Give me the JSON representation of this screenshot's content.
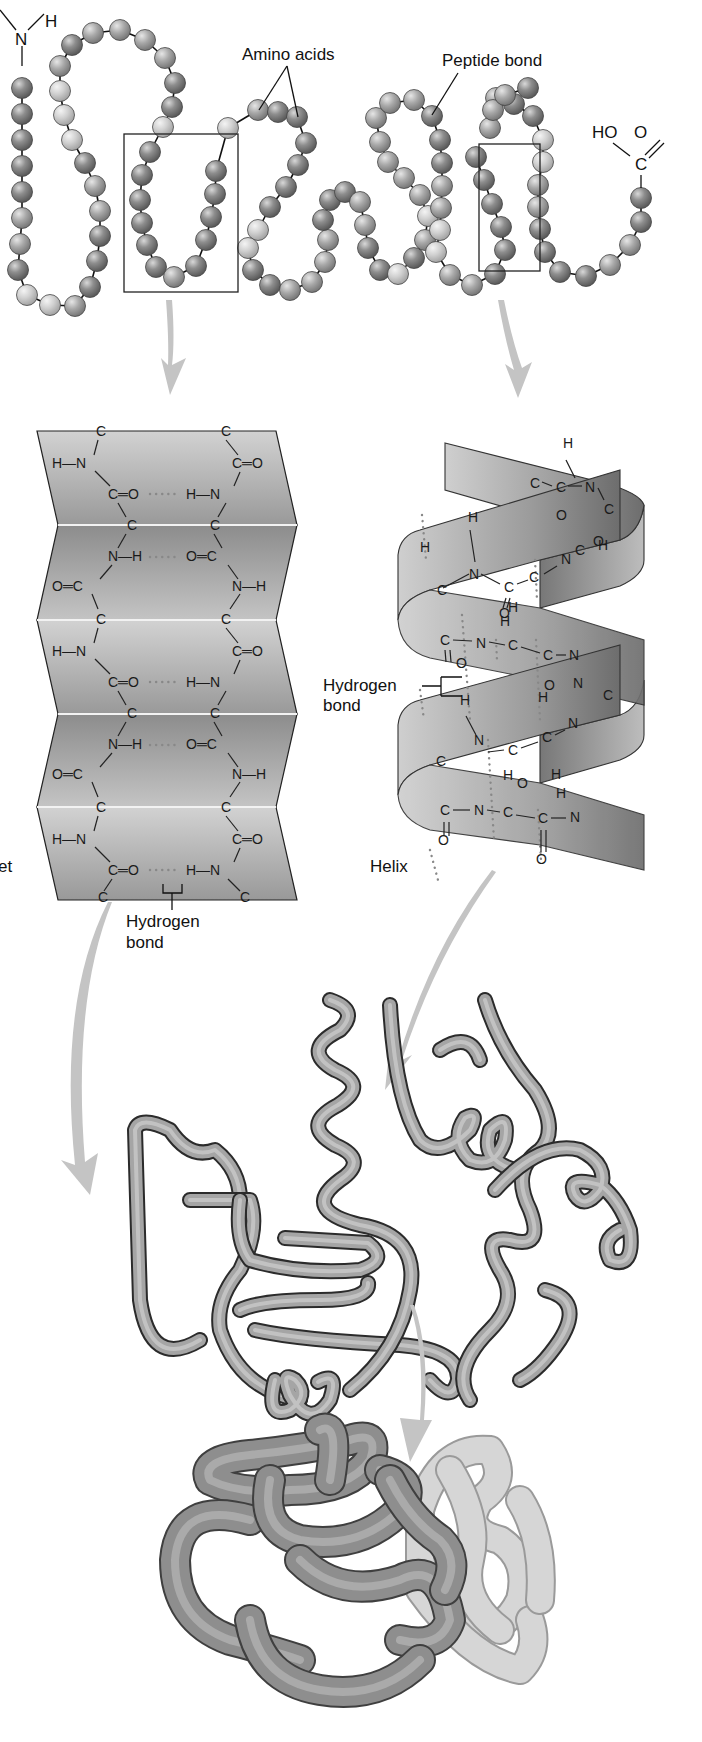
{
  "figure": {
    "primary": {
      "n_terminus": {
        "atom": "N",
        "hydrogen": "H"
      },
      "c_terminus": {
        "hydroxyl": "HO",
        "carbon": "C",
        "oxygen": "O"
      },
      "label_amino_acids": "Amino acids",
      "label_peptide_bond": "Peptide bond"
    },
    "sheet": {
      "label_partial": "et",
      "rows": [
        {
          "left": "H—N",
          "left_group": "C═O",
          "right": "C═O",
          "right_group": "H—N",
          "hbond": "C═O … H—N"
        },
        {
          "left": "N—H",
          "right": "O═C",
          "hbond": "N—H … O═C"
        }
      ],
      "atoms": {
        "C": "C",
        "N": "N",
        "H": "H",
        "O": "O",
        "HN": "H—N",
        "NH": "N—H",
        "CO": "C═O",
        "OC": "O═C",
        "CO_H_N": "C═O",
        "H_N": "H—N",
        "N_H": "N—H",
        "O_C": "O═C"
      },
      "hbond_label_line1": "Hydrogen",
      "hbond_label_line2": "bond"
    },
    "helix": {
      "label": "Helix",
      "hbond_label_line1": "Hydrogen",
      "hbond_label_line2": "bond",
      "atoms": {
        "C": "C",
        "N": "N",
        "H": "H",
        "O": "O"
      }
    },
    "tertiary": {
      "label": ""
    },
    "quaternary": {
      "label": ""
    },
    "colors": {
      "bead_dark": "#8a8a8a",
      "bead_mid": "#a8a8a8",
      "bead_light": "#cfcfcf",
      "sheet_fill": "#b5b5b5",
      "ribbon": "#9a9a9a",
      "globule_dark": "#8d8d8d",
      "globule_light": "#d4d4d4",
      "arrow": "#c4c4c4"
    }
  }
}
